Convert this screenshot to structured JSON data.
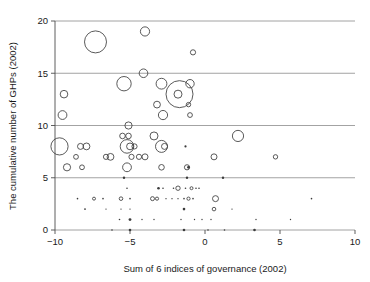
{
  "chart_data": {
    "type": "scatter",
    "title": "",
    "subtitle": "",
    "xlabel": "Sum of 6 indices of governance (2002)",
    "ylabel": "The cumulative number of GHPs (2002)",
    "xlim": [
      -10,
      10
    ],
    "ylim": [
      0,
      20
    ],
    "xticks": [
      -10,
      -5,
      0,
      5,
      10
    ],
    "yticks": [
      0,
      5,
      10,
      15,
      20
    ],
    "xtick_labels": [
      "−10",
      "−5",
      "0",
      "5",
      "10"
    ],
    "ytick_labels": [
      "0",
      "5",
      "10",
      "15",
      "20"
    ],
    "grid": "horizontal",
    "legend": "none",
    "marker": "open-circle",
    "marker_color": "#3c3c3c",
    "note": "Bubble sizes vary; radius encodes a third (unlabeled) magnitude.",
    "points": [
      {
        "x": -7.3,
        "y": 18,
        "r": 11.0
      },
      {
        "x": -4.0,
        "y": 19,
        "r": 4.6
      },
      {
        "x": -0.8,
        "y": 17,
        "r": 2.6
      },
      {
        "x": -4.1,
        "y": 15,
        "r": 4.3
      },
      {
        "x": -5.4,
        "y": 14,
        "r": 7.2
      },
      {
        "x": -2.9,
        "y": 14,
        "r": 5.4
      },
      {
        "x": -1.0,
        "y": 14,
        "r": 4.2
      },
      {
        "x": -9.4,
        "y": 13,
        "r": 3.8
      },
      {
        "x": -1.7,
        "y": 13,
        "r": 13.5
      },
      {
        "x": -1.8,
        "y": 13,
        "r": 4.0
      },
      {
        "x": -3.2,
        "y": 12,
        "r": 3.4
      },
      {
        "x": -1.1,
        "y": 12,
        "r": 2.2
      },
      {
        "x": -9.5,
        "y": 11,
        "r": 4.4
      },
      {
        "x": -2.8,
        "y": 11,
        "r": 4.6
      },
      {
        "x": -1.0,
        "y": 11,
        "r": 2.4
      },
      {
        "x": -5.1,
        "y": 10,
        "r": 3.6
      },
      {
        "x": -9.7,
        "y": 8,
        "r": 8.6
      },
      {
        "x": -8.3,
        "y": 8,
        "r": 3.0
      },
      {
        "x": -7.9,
        "y": 8,
        "r": 3.4
      },
      {
        "x": -5.5,
        "y": 9,
        "r": 2.8
      },
      {
        "x": -5.1,
        "y": 9,
        "r": 2.8
      },
      {
        "x": -3.4,
        "y": 9,
        "r": 4.0
      },
      {
        "x": 2.2,
        "y": 9,
        "r": 5.6
      },
      {
        "x": -5.2,
        "y": 8,
        "r": 6.8
      },
      {
        "x": -5.0,
        "y": 8,
        "r": 3.4
      },
      {
        "x": -4.7,
        "y": 8,
        "r": 2.6
      },
      {
        "x": -2.9,
        "y": 8,
        "r": 6.0
      },
      {
        "x": -2.7,
        "y": 8,
        "r": 3.0
      },
      {
        "x": -1.3,
        "y": 8,
        "r": 1.1
      },
      {
        "x": -8.6,
        "y": 7,
        "r": 2.4
      },
      {
        "x": -6.6,
        "y": 7,
        "r": 2.6
      },
      {
        "x": -6.3,
        "y": 7,
        "r": 3.4
      },
      {
        "x": -4.9,
        "y": 7,
        "r": 2.6
      },
      {
        "x": -4.4,
        "y": 7,
        "r": 2.6
      },
      {
        "x": -4.0,
        "y": 7,
        "r": 3.0
      },
      {
        "x": 0.6,
        "y": 7,
        "r": 3.0
      },
      {
        "x": 4.7,
        "y": 7,
        "r": 2.2
      },
      {
        "x": -9.2,
        "y": 6,
        "r": 3.6
      },
      {
        "x": -8.2,
        "y": 6,
        "r": 2.4
      },
      {
        "x": -5.2,
        "y": 6,
        "r": 4.4
      },
      {
        "x": -2.9,
        "y": 6,
        "r": 2.8
      },
      {
        "x": -1.2,
        "y": 6,
        "r": 2.6
      },
      {
        "x": -1.1,
        "y": 6,
        "r": 1.4
      },
      {
        "x": -5.4,
        "y": 5,
        "r": 1.2
      },
      {
        "x": -1.2,
        "y": 5,
        "r": 1.2
      },
      {
        "x": 1.2,
        "y": 5,
        "r": 1.2
      },
      {
        "x": -5.2,
        "y": 4,
        "r": 0.8
      },
      {
        "x": -3.1,
        "y": 4,
        "r": 1.3
      },
      {
        "x": -2.8,
        "y": 4,
        "r": 0.8
      },
      {
        "x": -2.1,
        "y": 4,
        "r": 0.8
      },
      {
        "x": -1.8,
        "y": 4,
        "r": 2.2
      },
      {
        "x": -1.3,
        "y": 4,
        "r": 0.8
      },
      {
        "x": -0.9,
        "y": 4,
        "r": 1.5
      },
      {
        "x": -0.6,
        "y": 4,
        "r": 0.8
      },
      {
        "x": -0.4,
        "y": 4,
        "r": 0.8
      },
      {
        "x": -8.5,
        "y": 3,
        "r": 0.8
      },
      {
        "x": -7.4,
        "y": 3,
        "r": 1.5
      },
      {
        "x": -6.8,
        "y": 3,
        "r": 0.8
      },
      {
        "x": -5.6,
        "y": 3,
        "r": 1.8
      },
      {
        "x": -5.0,
        "y": 3,
        "r": 0.8
      },
      {
        "x": -3.5,
        "y": 3,
        "r": 2.0
      },
      {
        "x": -3.2,
        "y": 3,
        "r": 1.6
      },
      {
        "x": -2.6,
        "y": 3,
        "r": 0.7
      },
      {
        "x": -2.2,
        "y": 3,
        "r": 0.7
      },
      {
        "x": -1.8,
        "y": 3,
        "r": 0.7
      },
      {
        "x": -1.4,
        "y": 3,
        "r": 0.8
      },
      {
        "x": -1.1,
        "y": 3,
        "r": 1.6
      },
      {
        "x": -0.8,
        "y": 3,
        "r": 0.8
      },
      {
        "x": 0.7,
        "y": 3,
        "r": 3.0
      },
      {
        "x": 7.1,
        "y": 3,
        "r": 0.8
      },
      {
        "x": -8.0,
        "y": 2,
        "r": 0.9
      },
      {
        "x": -6.6,
        "y": 2,
        "r": 0.7
      },
      {
        "x": -5.6,
        "y": 2,
        "r": 0.7
      },
      {
        "x": -5.0,
        "y": 2,
        "r": 0.7
      },
      {
        "x": -1.4,
        "y": 2,
        "r": 1.3
      },
      {
        "x": 0.6,
        "y": 2,
        "r": 1.8
      },
      {
        "x": 1.8,
        "y": 2,
        "r": 0.7
      },
      {
        "x": -5.7,
        "y": 1,
        "r": 0.8
      },
      {
        "x": -5.0,
        "y": 1,
        "r": 1.4
      },
      {
        "x": -4.2,
        "y": 1,
        "r": 0.7
      },
      {
        "x": -3.4,
        "y": 1,
        "r": 0.7
      },
      {
        "x": -1.6,
        "y": 1,
        "r": 0.7
      },
      {
        "x": -0.7,
        "y": 1,
        "r": 0.7
      },
      {
        "x": -0.2,
        "y": 1,
        "r": 0.7
      },
      {
        "x": 0.4,
        "y": 1,
        "r": 0.7
      },
      {
        "x": 3.4,
        "y": 1,
        "r": 0.7
      },
      {
        "x": 5.7,
        "y": 1,
        "r": 0.7
      },
      {
        "x": -6.2,
        "y": 0,
        "r": 0.8
      },
      {
        "x": -5.0,
        "y": 0,
        "r": 1.3
      },
      {
        "x": -1.4,
        "y": 0,
        "r": 1.3
      },
      {
        "x": 0.2,
        "y": 0,
        "r": 0.8
      },
      {
        "x": 1.3,
        "y": 0,
        "r": 0.8
      },
      {
        "x": 3.3,
        "y": 0,
        "r": 1.3
      }
    ]
  }
}
